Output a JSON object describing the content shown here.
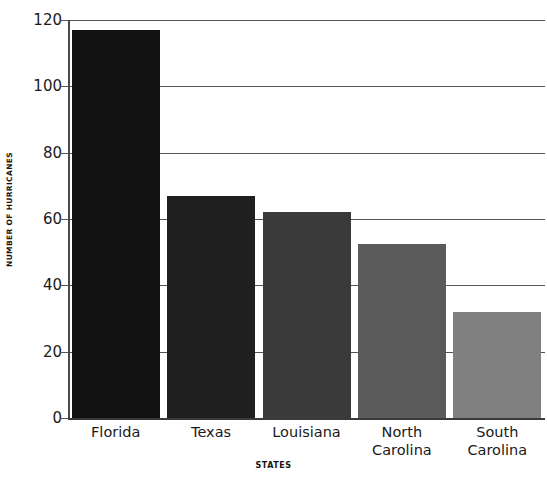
{
  "chart_data": {
    "type": "bar",
    "title": "",
    "subtitle": "",
    "xlabel": "STATES",
    "ylabel": "NUMBER OF HURRICANES",
    "categories": [
      "Florida",
      "Texas",
      "Louisiana",
      "North Carolina",
      "South Carolina"
    ],
    "category_lines": [
      [
        "Florida"
      ],
      [
        "Texas"
      ],
      [
        "Louisiana"
      ],
      [
        "North",
        "Carolina"
      ],
      [
        "South",
        "Carolina"
      ]
    ],
    "values": [
      117,
      67,
      62,
      52.5,
      32
    ],
    "bar_colors": [
      "#121212",
      "#1f1f1f",
      "#3a3a3a",
      "#5b5b5b",
      "#808080"
    ],
    "ylim": [
      0,
      120
    ],
    "yticks": [
      0,
      20,
      40,
      60,
      80,
      100,
      120
    ],
    "ytick_labels": [
      "0",
      "20",
      "40",
      "60",
      "80",
      "100",
      "120"
    ],
    "grid": true,
    "grid_axis": "y",
    "legend": false,
    "legend_position": "none",
    "background_color": "#ffffff",
    "gridline_color": "#555555",
    "axis_color": "#3a3a3a",
    "text_color": "#1a1a1a"
  }
}
